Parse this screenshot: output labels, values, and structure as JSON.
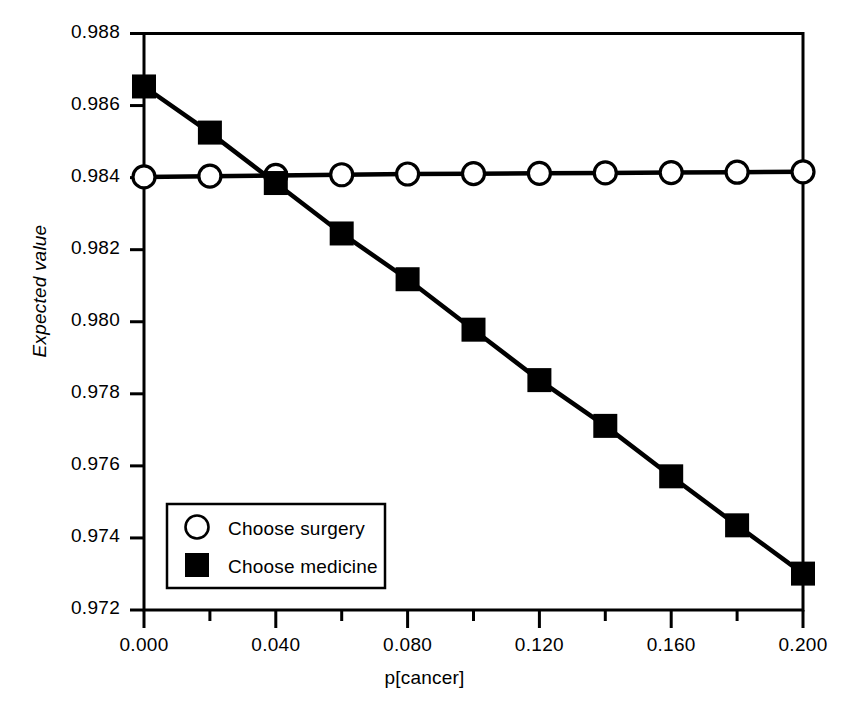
{
  "chart_data": {
    "type": "line",
    "title": "",
    "xlabel": "p[cancer]",
    "ylabel": "Expected value",
    "xlim": [
      0.0,
      0.2
    ],
    "ylim": [
      0.972,
      0.988
    ],
    "grid": false,
    "legend_position": "lower left inside axes",
    "x": [
      0.0,
      0.02,
      0.04,
      0.06,
      0.08,
      0.1,
      0.12,
      0.14,
      0.16,
      0.18,
      0.2
    ],
    "xticks": [
      0.0,
      0.02,
      0.04,
      0.06,
      0.08,
      0.1,
      0.12,
      0.14,
      0.16,
      0.18,
      0.2
    ],
    "xtick_labels": [
      "0.000",
      "",
      "0.040",
      "",
      "0.080",
      "",
      "0.120",
      "",
      "0.160",
      "",
      "0.200"
    ],
    "xtick_labels_major": [
      "0.000",
      "0.040",
      "0.080",
      "0.120",
      "0.160",
      "0.200"
    ],
    "yticks": [
      0.972,
      0.974,
      0.976,
      0.978,
      0.98,
      0.982,
      0.984,
      0.986,
      0.988
    ],
    "ytick_labels": [
      "0.972",
      "0.974",
      "0.976",
      "0.978",
      "0.980",
      "0.982",
      "0.984",
      "0.986",
      "0.988"
    ],
    "series": [
      {
        "name": "Choose surgery",
        "marker": "open-circle",
        "values": [
          0.98402,
          0.98404,
          0.98406,
          0.98408,
          0.9841,
          0.98411,
          0.98412,
          0.98413,
          0.98414,
          0.98415,
          0.98416
        ]
      },
      {
        "name": "Choose medicine",
        "marker": "filled-square",
        "values": [
          0.98653,
          0.98525,
          0.98385,
          0.98245,
          0.98118,
          0.97978,
          0.97838,
          0.97711,
          0.97571,
          0.97435,
          0.97301
        ]
      }
    ]
  },
  "legend": {
    "items": [
      {
        "label": "Choose surgery",
        "marker": "open-circle"
      },
      {
        "label": "Choose medicine",
        "marker": "filled-square"
      }
    ]
  },
  "axes": {
    "x_label": "p[cancer]",
    "y_label": "Expected value"
  },
  "colors": {
    "ink": "#000000",
    "background": "#ffffff"
  }
}
